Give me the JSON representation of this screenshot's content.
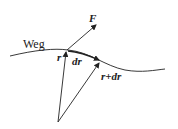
{
  "diagram": {
    "path_label": "Weg",
    "force_label": "F",
    "position_label": "r",
    "displacement_label": "dr",
    "new_position_label": "r+dr",
    "colors": {
      "stroke": "#222222",
      "background": "#ffffff"
    }
  }
}
